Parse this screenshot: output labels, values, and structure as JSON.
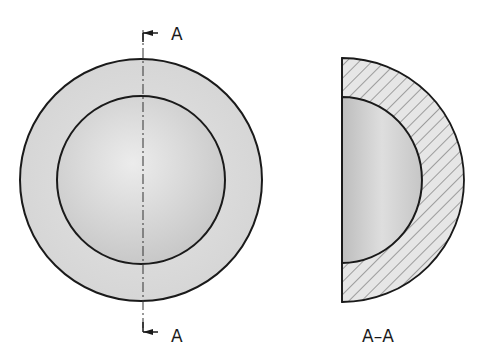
{
  "drawing": {
    "section_marker_top": "A",
    "section_marker_bottom": "A",
    "section_view_label": "A–A"
  },
  "colors": {
    "stroke": "#1a1a1a",
    "shell_fill": "#dcdcdc",
    "sphere_light": "#e8e8e8",
    "sphere_dark": "#bdbdbd",
    "hatch": "#555555"
  }
}
